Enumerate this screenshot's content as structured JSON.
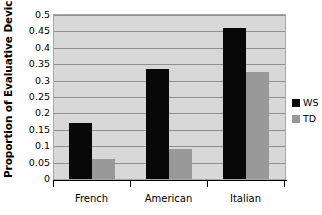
{
  "chart_data": {
    "type": "bar",
    "title": "",
    "xlabel": "",
    "ylabel": "Proportion of Evaluative Devices",
    "categories": [
      "French",
      "American",
      "Italian"
    ],
    "series": [
      {
        "name": "WS",
        "color": "#080808",
        "values": [
          0.17,
          0.335,
          0.46
        ]
      },
      {
        "name": "TD",
        "color": "#999999",
        "values": [
          0.06,
          0.09,
          0.325
        ]
      }
    ],
    "ylim": [
      0,
      0.5
    ],
    "ytick_step": 0.05,
    "yticks": [
      0.5,
      0.45,
      0.4,
      0.35,
      0.3,
      0.25,
      0.2,
      0.15,
      0.1,
      0.05,
      0
    ],
    "ytick_labels": [
      "0.5",
      "0.45",
      "0.4",
      "0.35",
      "0.3",
      "0.25",
      "0.2",
      "0.15",
      "0.1",
      "0.05",
      "0"
    ],
    "grid": true,
    "grid_axis": "y",
    "legend_position": "right",
    "plot_background": "#d8d8d8"
  },
  "legend": {
    "entries": [
      {
        "label": "WS",
        "color": "#080808"
      },
      {
        "label": "TD",
        "color": "#999999"
      }
    ]
  }
}
